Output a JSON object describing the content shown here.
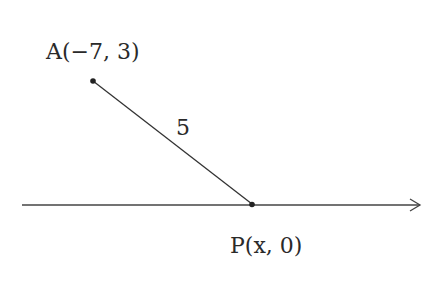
{
  "diagram": {
    "type": "coordinate-geometry",
    "points": {
      "A": {
        "label": "A(−7, 3)",
        "px": [
          93,
          81
        ]
      },
      "P": {
        "label": "P(x, 0)",
        "px": [
          252,
          204
        ]
      }
    },
    "segment_AP": {
      "length_label": "5"
    },
    "axis": {
      "name": "x-axis",
      "direction": "right-arrow"
    },
    "colors": {
      "line": "#333333",
      "text": "#2a2a2a",
      "background": "#ffffff"
    }
  }
}
